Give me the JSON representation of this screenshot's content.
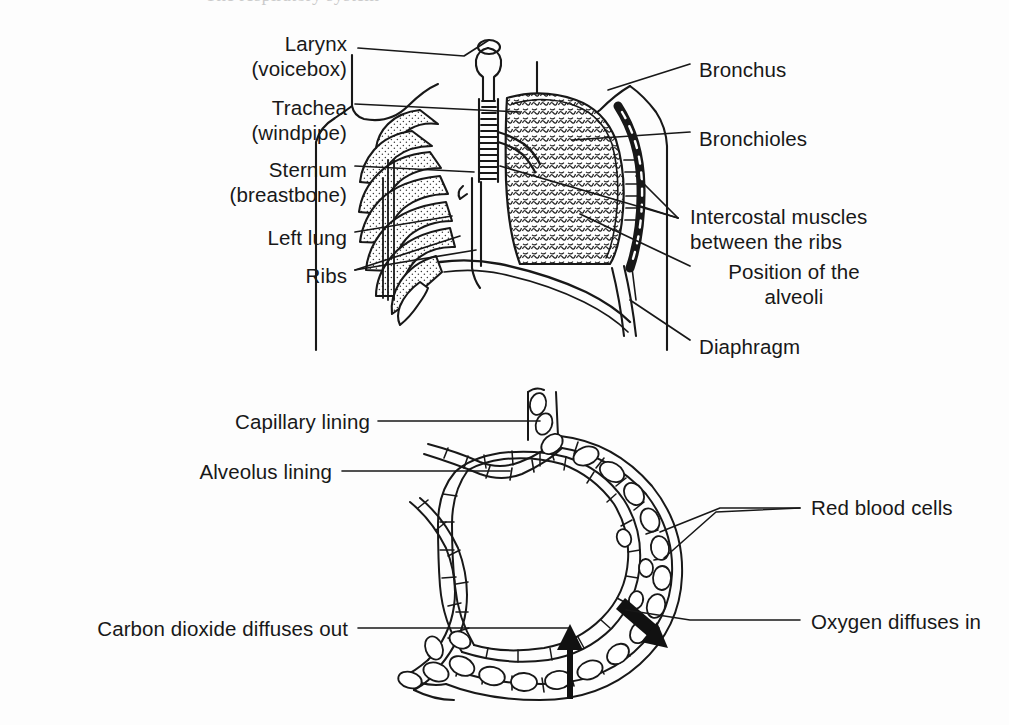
{
  "page": {
    "title": "The respiratory system",
    "background_color": "#fdfdfd",
    "ink_color": "#181818",
    "partial_heading_text": "The respiratory system"
  },
  "figures": [
    {
      "id": "thorax",
      "name": "thorax-diagram",
      "caption": "Human thorax showing the lungs, ribs and diaphragm"
    },
    {
      "id": "alveolus",
      "name": "alveolus-diagram",
      "caption": "Alveolus and surrounding capillary showing gas exchange"
    }
  ],
  "thorax_labels": [
    {
      "id": "larynx",
      "text": "Larynx\n(voicebox)",
      "side": "left",
      "x": 347,
      "y": 31,
      "align": "right"
    },
    {
      "id": "trachea",
      "text": "Trachea\n(windpipe)",
      "side": "left",
      "x": 347,
      "y": 95,
      "align": "right"
    },
    {
      "id": "sternum",
      "text": "Sternum\n(breastbone)",
      "side": "left",
      "x": 347,
      "y": 157,
      "align": "right"
    },
    {
      "id": "left-lung",
      "text": "Left lung",
      "side": "left",
      "x": 347,
      "y": 225,
      "align": "right"
    },
    {
      "id": "ribs",
      "text": "Ribs",
      "side": "left",
      "x": 347,
      "y": 263,
      "align": "right"
    },
    {
      "id": "bronchus",
      "text": "Bronchus",
      "side": "right",
      "x": 699,
      "y": 57,
      "align": "left"
    },
    {
      "id": "bronchioles",
      "text": "Bronchioles",
      "side": "right",
      "x": 699,
      "y": 126,
      "align": "left"
    },
    {
      "id": "intercostal",
      "text": "Intercostal muscles\nbetween the ribs",
      "side": "right",
      "x": 690,
      "y": 204,
      "align": "left"
    },
    {
      "id": "alveoli-pos",
      "text": "Position of the\nalveoli",
      "side": "right",
      "x": 699,
      "y": 259,
      "align": "left"
    },
    {
      "id": "diaphragm",
      "text": "Diaphragm",
      "side": "right",
      "x": 699,
      "y": 334,
      "align": "left"
    }
  ],
  "alveolus_labels": [
    {
      "id": "capillary-lining",
      "text": "Capillary lining",
      "side": "left",
      "x": 370,
      "y": 409,
      "align": "right"
    },
    {
      "id": "alveolus-lining",
      "text": "Alveolus lining",
      "side": "left",
      "x": 332,
      "y": 459,
      "align": "right"
    },
    {
      "id": "co2-out",
      "text": "Carbon dioxide diffuses out",
      "side": "left",
      "x": 348,
      "y": 616,
      "align": "right"
    },
    {
      "id": "rbc",
      "text": "Red blood cells",
      "side": "right",
      "x": 811,
      "y": 495,
      "align": "left"
    },
    {
      "id": "o2-in",
      "text": "Oxygen diffuses in",
      "side": "right",
      "x": 811,
      "y": 609,
      "align": "left"
    }
  ],
  "arrows": [
    {
      "id": "co2-arrow",
      "name": "co2-diffusion-arrow",
      "direction": "up",
      "meaning": "Carbon dioxide diffuses out"
    },
    {
      "id": "o2-arrow",
      "name": "o2-diffusion-arrow",
      "direction": "down-left",
      "meaning": "Oxygen diffuses in"
    }
  ]
}
